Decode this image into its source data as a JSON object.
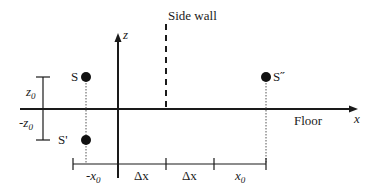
{
  "diagram": {
    "labels": {
      "side_wall": "Side wall",
      "floor": "Floor",
      "x_axis": "x",
      "z_axis": "z",
      "source": "S",
      "image_floor": "S'",
      "image_wall": "S˝",
      "z0": "z",
      "z0_sub": "0",
      "neg_z0": "-z",
      "neg_z0_sub": "0",
      "neg_x0": "-x",
      "neg_x0_sub": "0",
      "dx1": "Δx",
      "dx2": "Δx",
      "x0": "x",
      "x0_sub": "0"
    },
    "colors": {
      "line": "#1a1a1a",
      "dotted": "#555555"
    }
  }
}
